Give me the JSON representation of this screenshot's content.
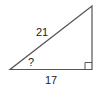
{
  "diagram": {
    "type": "right-triangle",
    "hypotenuse_label": "21",
    "base_label": "17",
    "angle_label": "?",
    "stroke_color": "#555555"
  }
}
